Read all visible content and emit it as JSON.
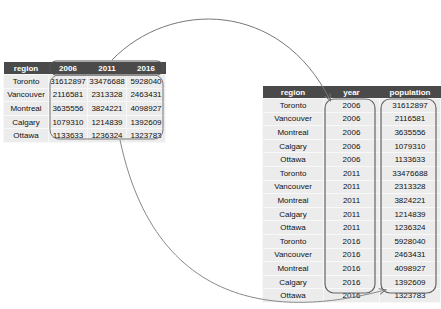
{
  "wide_table": {
    "headers": [
      "region",
      "2006",
      "2011",
      "2016"
    ],
    "rows": [
      [
        "Toronto",
        "31612897",
        "33476688",
        "5928040"
      ],
      [
        "Vancouver",
        "2116581",
        "2313328",
        "2463431"
      ],
      [
        "Montreal",
        "3635556",
        "3824221",
        "4098927"
      ],
      [
        "Calgary",
        "1079310",
        "1214839",
        "1392609"
      ],
      [
        "Ottawa",
        "1133633",
        "1236324",
        "1323783"
      ]
    ]
  },
  "long_table": {
    "headers": [
      "region",
      "year",
      "population"
    ],
    "rows": [
      [
        "Toronto",
        "2006",
        "31612897"
      ],
      [
        "Vancouver",
        "2006",
        "2116581"
      ],
      [
        "Montreal",
        "2006",
        "3635556"
      ],
      [
        "Calgary",
        "2006",
        "1079310"
      ],
      [
        "Ottawa",
        "2006",
        "1133633"
      ],
      [
        "Toronto",
        "2011",
        "33476688"
      ],
      [
        "Vancouver",
        "2011",
        "2313328"
      ],
      [
        "Montreal",
        "2011",
        "3824221"
      ],
      [
        "Calgary",
        "2011",
        "1214839"
      ],
      [
        "Ottawa",
        "2011",
        "1236324"
      ],
      [
        "Toronto",
        "2016",
        "5928040"
      ],
      [
        "Vancouver",
        "2016",
        "2463431"
      ],
      [
        "Montreal",
        "2016",
        "4098927"
      ],
      [
        "Calgary",
        "2016",
        "1392609"
      ],
      [
        "Ottawa",
        "2016",
        "1323783"
      ]
    ]
  },
  "colors": {
    "header_bg": "#4a4a4a",
    "cell_bg": "#ececec",
    "outline": "#666666"
  }
}
